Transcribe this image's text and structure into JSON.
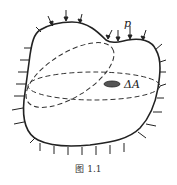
{
  "figure": {
    "caption": "图 1.1",
    "labels": {
      "pressure": "p",
      "area_element": "ΔA"
    },
    "colors": {
      "stroke": "#222222",
      "background": "#ffffff"
    }
  }
}
